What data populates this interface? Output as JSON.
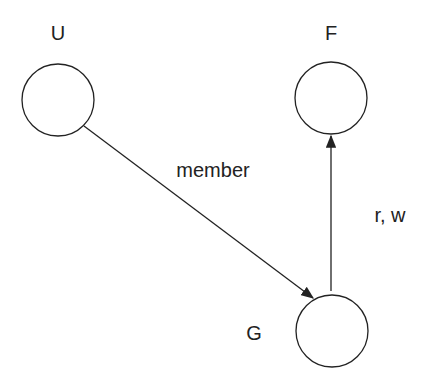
{
  "nodes": [
    {
      "id": "U",
      "label": "U"
    },
    {
      "id": "F",
      "label": "F"
    },
    {
      "id": "G",
      "label": "G"
    }
  ],
  "edges": [
    {
      "from": "U",
      "to": "G",
      "label": "member"
    },
    {
      "from": "G",
      "to": "F",
      "label": "r, w"
    }
  ],
  "colors": {
    "stroke": "#222222",
    "background": "#ffffff"
  }
}
